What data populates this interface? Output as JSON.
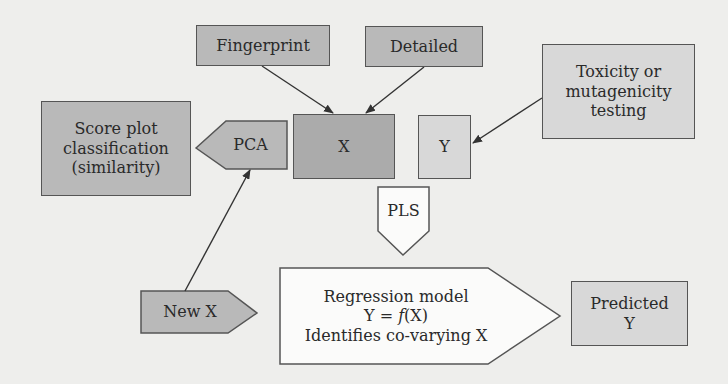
{
  "diagram": {
    "nodes": {
      "fingerprint": {
        "label": "Fingerprint"
      },
      "detailed": {
        "label": "Detailed"
      },
      "toxicity": {
        "line1": "Toxicity or",
        "line2": "mutagenicity",
        "line3": "testing"
      },
      "score_plot": {
        "line1": "Score plot",
        "line2": "classification",
        "line3": "(similarity)"
      },
      "pca": {
        "label": "PCA"
      },
      "x": {
        "label": "X"
      },
      "y": {
        "label": "Y"
      },
      "pls": {
        "label": "PLS"
      },
      "new_x": {
        "label": "New X"
      },
      "regression": {
        "line1": "Regression model",
        "eq_left": "Y = ",
        "eq_f": "f",
        "eq_right": "(X)",
        "line3": "Identifies co-varying X"
      },
      "predicted_y": {
        "line1": "Predicted",
        "line2": "Y"
      }
    },
    "edges": [
      {
        "from": "fingerprint",
        "to": "x"
      },
      {
        "from": "detailed",
        "to": "x"
      },
      {
        "from": "toxicity",
        "to": "y"
      },
      {
        "from": "new_x",
        "to": "pca"
      }
    ],
    "colors": {
      "background": "#eeeeec",
      "dark_fill": "#ababab",
      "mid_fill": "#b9b9b9",
      "light_fill": "#d8d8d8",
      "stroke": "#555555"
    }
  }
}
